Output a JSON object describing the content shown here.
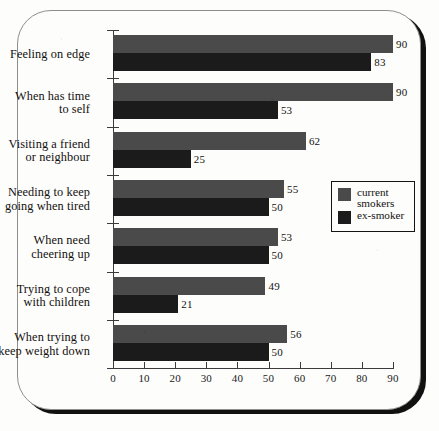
{
  "chart_data": {
    "type": "bar",
    "orientation": "horizontal",
    "title": "",
    "xlabel": "",
    "ylabel": "",
    "xlim": [
      0,
      90
    ],
    "xticks": [
      0,
      10,
      20,
      30,
      40,
      50,
      60,
      70,
      80,
      90
    ],
    "grid": false,
    "legend_position": "middle-right",
    "categories": [
      "Feeling on edge",
      "When has time\nto self",
      "Visiting a friend\nor neighbour",
      "Needing to keep\ngoing when tired",
      "When need\ncheering up",
      "Trying to cope\nwith children",
      "When trying to\nkeep weight down"
    ],
    "series": [
      {
        "name": "current\nsmokers",
        "legend_label": "current\nsmokers",
        "color": "#4a4a4a",
        "values": [
          90,
          90,
          62,
          55,
          53,
          49,
          56
        ]
      },
      {
        "name": "ex-smoker",
        "legend_label": "ex-smoker",
        "color": "#1b1b1b",
        "values": [
          83,
          53,
          25,
          50,
          50,
          21,
          50
        ]
      }
    ]
  },
  "colors": {
    "current_smokers": "#4a4a4a",
    "ex_smoker": "#1b1b1b",
    "axis": "#3b3b3b",
    "frame_shadow": "#111111",
    "paper": "#fdfdfc"
  }
}
